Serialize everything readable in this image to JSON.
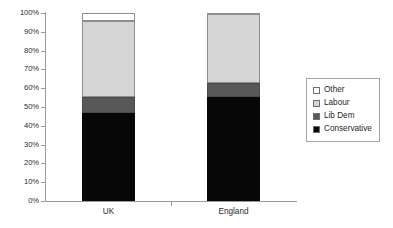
{
  "chart_data": {
    "type": "bar",
    "subtype": "100% stacked column",
    "title": "",
    "subtitle": "",
    "xlabel": "",
    "ylabel": "",
    "categories": [
      "UK",
      "England"
    ],
    "series": [
      {
        "name": "Conservative",
        "color": "#070707",
        "values": [
          47.0,
          55.5
        ]
      },
      {
        "name": "Lib Dem",
        "color": "#585858",
        "values": [
          8.5,
          7.5
        ]
      },
      {
        "name": "Labour",
        "color": "#d5d5d5",
        "values": [
          40.0,
          36.5
        ]
      },
      {
        "name": "Other",
        "color": "#ffffff",
        "values": [
          4.5,
          0.5
        ]
      }
    ],
    "stack_order_bottom_to_top": [
      "Conservative",
      "Lib Dem",
      "Labour",
      "Other"
    ],
    "ylim": [
      0,
      100
    ],
    "y_ticks": [
      0,
      10,
      20,
      30,
      40,
      50,
      60,
      70,
      80,
      90,
      100
    ],
    "y_tick_labels": [
      "0%",
      "10%",
      "20%",
      "30%",
      "40%",
      "50%",
      "60%",
      "70%",
      "80%",
      "90%",
      "100%"
    ],
    "grid": false,
    "legend_position": "right",
    "legend_entries": [
      "Other",
      "Labour",
      "Lib Dem",
      "Conservative"
    ],
    "annotations": []
  },
  "axes": {
    "y_tick_labels": [
      "100%",
      "90%",
      "80%",
      "70%",
      "60%",
      "50%",
      "40%",
      "30%",
      "20%",
      "10%",
      "0%"
    ],
    "x_tick_labels": [
      "UK",
      "England"
    ]
  },
  "legend": {
    "items": [
      {
        "label": "Other",
        "swatch": "legend-swatch-other"
      },
      {
        "label": "Labour",
        "swatch": "legend-swatch-labour"
      },
      {
        "label": "Lib Dem",
        "swatch": "legend-swatch-libdem"
      },
      {
        "label": "Conservative",
        "swatch": "legend-swatch-conservative"
      }
    ]
  },
  "colors": {
    "conservative": "#070707",
    "libdem": "#585858",
    "labour": "#d5d5d5",
    "other": "#ffffff",
    "axis": "#9a9a9a",
    "text": "#2b2b2b"
  }
}
